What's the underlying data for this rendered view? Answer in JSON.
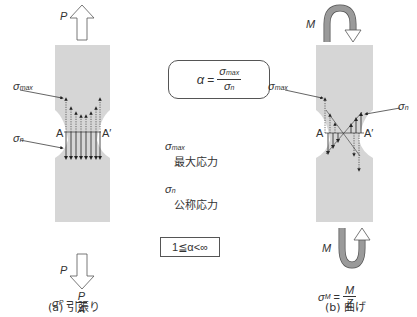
{
  "figure": {
    "left_panel": {
      "load_label": "P",
      "sigma_max_label": "σ",
      "sigma_max_sub": "max",
      "sigma_n_label": "σ",
      "sigma_n_sub": "n",
      "section_left": "A",
      "section_right": "A′",
      "formula_lhs": "σ",
      "formula_lhs_sub": "P",
      "formula_eq": "=",
      "formula_num": "P",
      "formula_den": "A",
      "caption": "(a) 引張り"
    },
    "right_panel": {
      "load_label": "M",
      "sigma_max_label": "σ",
      "sigma_max_sub": "max",
      "sigma_n_label": "σ",
      "sigma_n_sub": "n",
      "section_left": "A",
      "section_right": "A′",
      "formula_lhs": "σ",
      "formula_lhs_sub": "M",
      "formula_eq": "=",
      "formula_num": "M",
      "formula_den": "Z",
      "caption": "(b) 曲げ"
    },
    "center": {
      "alpha_formula": {
        "lhs": "α",
        "eq": "=",
        "num": "σ",
        "num_sub": "max",
        "den": "σ",
        "den_sub": "n"
      },
      "legend": [
        {
          "symbol": "σ",
          "sub": "max",
          "text": "最大応力"
        },
        {
          "symbol": "σ",
          "sub": "n",
          "text": "公称応力"
        }
      ],
      "range": "1≦α<∞"
    },
    "colors": {
      "specimen": "#d6d6d6",
      "arrow_fill": "#ffffff",
      "moment_fill": "#9a9a9a",
      "stroke": "#333333"
    }
  }
}
